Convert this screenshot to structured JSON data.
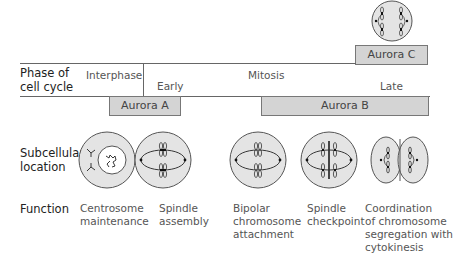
{
  "rows": {
    "phase": "Phase of\ncell cycle",
    "phase_line1": "Phase of",
    "phase_line2": "cell cycle",
    "subcellular_line1": "Subcellular",
    "subcellular_line2": "location",
    "function": "Function"
  },
  "phases": {
    "interphase": "Interphase",
    "mitosis": "Mitosis",
    "early": "Early",
    "late": "Late"
  },
  "kinases": [
    {
      "label": "Aurora A",
      "fill": "#d4d4d4"
    },
    {
      "label": "Aurora B",
      "fill": "#d4d4d4"
    },
    {
      "label": "Aurora C",
      "fill": "#d4d4d4"
    }
  ],
  "functions": [
    {
      "lines": [
        "Centrosome",
        "maintenance"
      ]
    },
    {
      "lines": [
        "Spindle",
        "assembly"
      ]
    },
    {
      "lines": [
        "Bipolar",
        "chromosome",
        "attachment"
      ]
    },
    {
      "lines": [
        "Spindle",
        "checkpoint"
      ]
    },
    {
      "lines": [
        "Coordination",
        "of chromosome",
        "segregation with",
        "cytokinesis"
      ]
    }
  ],
  "colors": {
    "cell_fill": "#e4e4e4",
    "bar_fill": "#d4d4d4",
    "stroke": "#555555"
  }
}
